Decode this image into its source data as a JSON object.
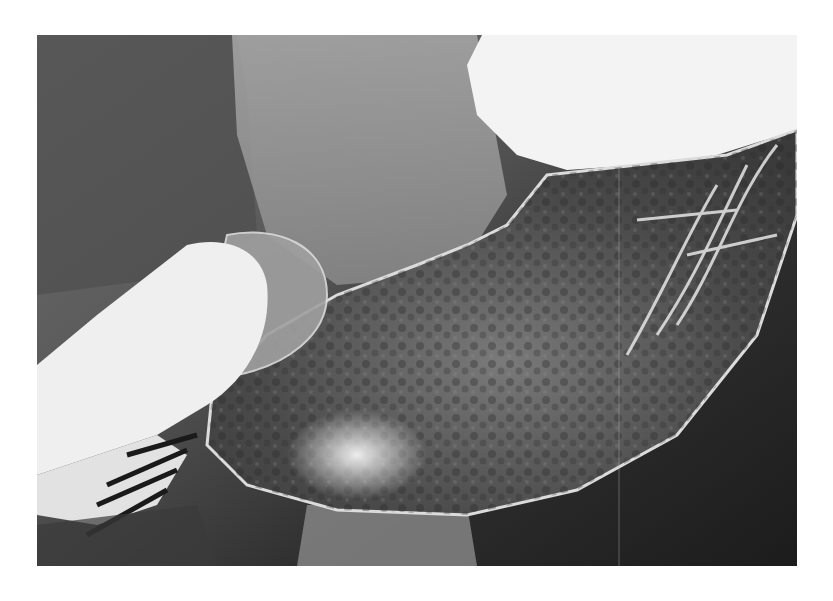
{
  "image": {
    "kind": "radiograph",
    "subject": "barium contrast study of stomach",
    "colormode": "grayscale",
    "frame": {
      "x": 37,
      "y": 35,
      "width": 760,
      "height": 531
    },
    "background": "#ffffff",
    "regions": [
      {
        "name": "fundus-barium-pool",
        "tone": "#f2f2f2"
      },
      {
        "name": "stomach-body",
        "tone": "#5a5a5a"
      },
      {
        "name": "duodenal-bulb",
        "tone": "#9a9a9a"
      },
      {
        "name": "barium-filled-duodenum",
        "tone": "#eeeeee"
      },
      {
        "name": "spine-shadow",
        "tone": "#8c8c8c"
      }
    ]
  }
}
